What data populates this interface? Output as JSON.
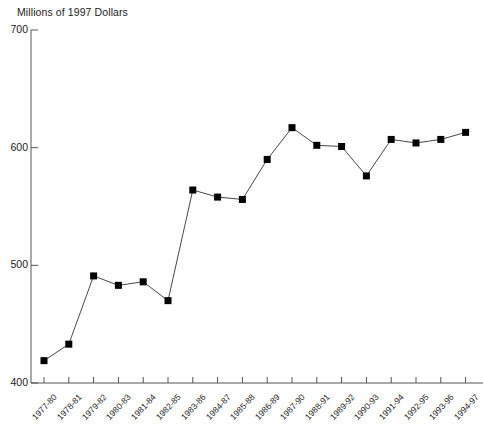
{
  "chart_data": {
    "type": "line",
    "title": "Millions of 1997 Dollars",
    "xlabel": "",
    "ylabel": "",
    "ylim": [
      400,
      700
    ],
    "yticks": [
      400,
      500,
      600,
      700
    ],
    "ytick_labels": [
      "400",
      "500",
      "600",
      "700"
    ],
    "grid": false,
    "legend": null,
    "marker": "filled-square",
    "line_color": "#333333",
    "marker_color": "#000000",
    "categories": [
      "1977-80",
      "1978-81",
      "1979-82",
      "1980-83",
      "1981-84",
      "1982-85",
      "1983-86",
      "1984-87",
      "1985-88",
      "1986-89",
      "1987-90",
      "1988-91",
      "1989-92",
      "1990-93",
      "1991-94",
      "1992-95",
      "1993-96",
      "1994-97"
    ],
    "values": [
      419,
      433,
      491,
      483,
      486,
      470,
      564,
      558,
      556,
      590,
      617,
      602,
      601,
      576,
      607,
      604,
      607,
      613
    ]
  }
}
